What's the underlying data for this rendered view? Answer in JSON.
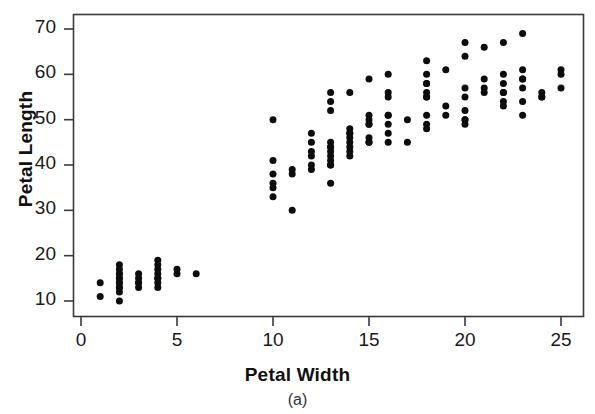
{
  "chart_data": {
    "type": "scatter",
    "title": "",
    "xlabel": "Petal Width",
    "ylabel": "Petal Length",
    "caption": "(a)",
    "xlim": [
      -1,
      26.5
    ],
    "ylim": [
      6.5,
      72.5
    ],
    "xticks": [
      0,
      5,
      10,
      15,
      20,
      25
    ],
    "yticks": [
      10,
      20,
      30,
      40,
      50,
      60,
      70
    ],
    "grid": false,
    "legend": null,
    "marker": {
      "shape": "circle",
      "color": "#0d0d0d",
      "size_px": 7
    },
    "points": [
      {
        "x": 1,
        "y": 14
      },
      {
        "x": 1,
        "y": 11
      },
      {
        "x": 2,
        "y": 18
      },
      {
        "x": 2,
        "y": 17
      },
      {
        "x": 2,
        "y": 16
      },
      {
        "x": 2,
        "y": 16
      },
      {
        "x": 2,
        "y": 15
      },
      {
        "x": 2,
        "y": 15
      },
      {
        "x": 2,
        "y": 14
      },
      {
        "x": 2,
        "y": 14
      },
      {
        "x": 2,
        "y": 13
      },
      {
        "x": 2,
        "y": 13
      },
      {
        "x": 2,
        "y": 12
      },
      {
        "x": 2,
        "y": 10
      },
      {
        "x": 3,
        "y": 16
      },
      {
        "x": 3,
        "y": 15
      },
      {
        "x": 3,
        "y": 14
      },
      {
        "x": 3,
        "y": 14
      },
      {
        "x": 3,
        "y": 13
      },
      {
        "x": 4,
        "y": 19
      },
      {
        "x": 4,
        "y": 18
      },
      {
        "x": 4,
        "y": 17
      },
      {
        "x": 4,
        "y": 16
      },
      {
        "x": 4,
        "y": 15
      },
      {
        "x": 4,
        "y": 15
      },
      {
        "x": 4,
        "y": 14
      },
      {
        "x": 4,
        "y": 13
      },
      {
        "x": 5,
        "y": 17
      },
      {
        "x": 5,
        "y": 16
      },
      {
        "x": 6,
        "y": 16
      },
      {
        "x": 10,
        "y": 50
      },
      {
        "x": 10,
        "y": 41
      },
      {
        "x": 10,
        "y": 38
      },
      {
        "x": 10,
        "y": 36
      },
      {
        "x": 10,
        "y": 35
      },
      {
        "x": 10,
        "y": 33
      },
      {
        "x": 11,
        "y": 39
      },
      {
        "x": 11,
        "y": 38
      },
      {
        "x": 11,
        "y": 30
      },
      {
        "x": 12,
        "y": 45
      },
      {
        "x": 12,
        "y": 43
      },
      {
        "x": 12,
        "y": 42
      },
      {
        "x": 12,
        "y": 40
      },
      {
        "x": 12,
        "y": 39
      },
      {
        "x": 12,
        "y": 47
      },
      {
        "x": 13,
        "y": 56
      },
      {
        "x": 13,
        "y": 54
      },
      {
        "x": 13,
        "y": 52
      },
      {
        "x": 13,
        "y": 45
      },
      {
        "x": 13,
        "y": 44
      },
      {
        "x": 13,
        "y": 44
      },
      {
        "x": 13,
        "y": 43
      },
      {
        "x": 13,
        "y": 42
      },
      {
        "x": 13,
        "y": 41
      },
      {
        "x": 13,
        "y": 40
      },
      {
        "x": 13,
        "y": 40
      },
      {
        "x": 13,
        "y": 36
      },
      {
        "x": 14,
        "y": 48
      },
      {
        "x": 14,
        "y": 47
      },
      {
        "x": 14,
        "y": 47
      },
      {
        "x": 14,
        "y": 46
      },
      {
        "x": 14,
        "y": 45
      },
      {
        "x": 14,
        "y": 44
      },
      {
        "x": 14,
        "y": 43
      },
      {
        "x": 14,
        "y": 42
      },
      {
        "x": 14,
        "y": 56
      },
      {
        "x": 15,
        "y": 51
      },
      {
        "x": 15,
        "y": 50
      },
      {
        "x": 15,
        "y": 49
      },
      {
        "x": 15,
        "y": 49
      },
      {
        "x": 15,
        "y": 46
      },
      {
        "x": 15,
        "y": 45
      },
      {
        "x": 15,
        "y": 45
      },
      {
        "x": 15,
        "y": 59
      },
      {
        "x": 16,
        "y": 56
      },
      {
        "x": 16,
        "y": 55
      },
      {
        "x": 16,
        "y": 51
      },
      {
        "x": 16,
        "y": 51
      },
      {
        "x": 16,
        "y": 49
      },
      {
        "x": 16,
        "y": 47
      },
      {
        "x": 16,
        "y": 45
      },
      {
        "x": 16,
        "y": 60
      },
      {
        "x": 17,
        "y": 50
      },
      {
        "x": 17,
        "y": 45
      },
      {
        "x": 18,
        "y": 63
      },
      {
        "x": 18,
        "y": 60
      },
      {
        "x": 18,
        "y": 58
      },
      {
        "x": 18,
        "y": 56
      },
      {
        "x": 18,
        "y": 55
      },
      {
        "x": 18,
        "y": 55
      },
      {
        "x": 18,
        "y": 51
      },
      {
        "x": 18,
        "y": 49
      },
      {
        "x": 18,
        "y": 48
      },
      {
        "x": 18,
        "y": 58
      },
      {
        "x": 19,
        "y": 61
      },
      {
        "x": 19,
        "y": 51
      },
      {
        "x": 19,
        "y": 53
      },
      {
        "x": 20,
        "y": 67
      },
      {
        "x": 20,
        "y": 64
      },
      {
        "x": 20,
        "y": 57
      },
      {
        "x": 20,
        "y": 55
      },
      {
        "x": 20,
        "y": 52
      },
      {
        "x": 20,
        "y": 50
      },
      {
        "x": 20,
        "y": 50
      },
      {
        "x": 20,
        "y": 49
      },
      {
        "x": 21,
        "y": 66
      },
      {
        "x": 21,
        "y": 59
      },
      {
        "x": 21,
        "y": 57
      },
      {
        "x": 21,
        "y": 56
      },
      {
        "x": 22,
        "y": 67
      },
      {
        "x": 22,
        "y": 60
      },
      {
        "x": 22,
        "y": 58
      },
      {
        "x": 22,
        "y": 56
      },
      {
        "x": 22,
        "y": 56
      },
      {
        "x": 22,
        "y": 54
      },
      {
        "x": 22,
        "y": 53
      },
      {
        "x": 23,
        "y": 69
      },
      {
        "x": 23,
        "y": 61
      },
      {
        "x": 23,
        "y": 59
      },
      {
        "x": 23,
        "y": 57
      },
      {
        "x": 23,
        "y": 54
      },
      {
        "x": 23,
        "y": 51
      },
      {
        "x": 23,
        "y": 59
      },
      {
        "x": 24,
        "y": 56
      },
      {
        "x": 24,
        "y": 55
      },
      {
        "x": 24,
        "y": 55
      },
      {
        "x": 25,
        "y": 61
      },
      {
        "x": 25,
        "y": 60
      },
      {
        "x": 25,
        "y": 57
      }
    ]
  }
}
